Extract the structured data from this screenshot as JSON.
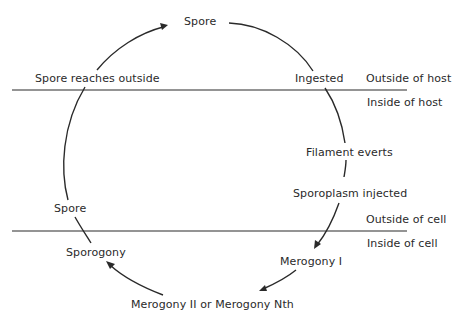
{
  "diagram": {
    "type": "life-cycle",
    "boundaries": [
      {
        "name": "host-boundary",
        "above_label": "Outside of host",
        "below_label": "Inside of host"
      },
      {
        "name": "cell-boundary",
        "above_label": "Outside of cell",
        "below_label": "Inside of cell"
      }
    ],
    "stages": {
      "spore_top": "Spore",
      "ingested": "Ingested",
      "filament_everts": "Filament everts",
      "sporoplasm_injected": "Sporoplasm injected",
      "merogony_1": "Merogony I",
      "merogony_n": "Merogony II or Merogony Nth",
      "sporogony": "Sporogony",
      "spore_left": "Spore",
      "spore_reaches_outside": "Spore reaches outside"
    },
    "cycle_order": [
      "Spore",
      "Ingested",
      "Filament everts",
      "Sporoplasm injected",
      "Merogony I",
      "Merogony II or Merogony Nth",
      "Sporogony",
      "Spore",
      "Spore reaches outside"
    ],
    "colors": {
      "stroke": "#2a2a2a",
      "background": "#ffffff"
    }
  }
}
